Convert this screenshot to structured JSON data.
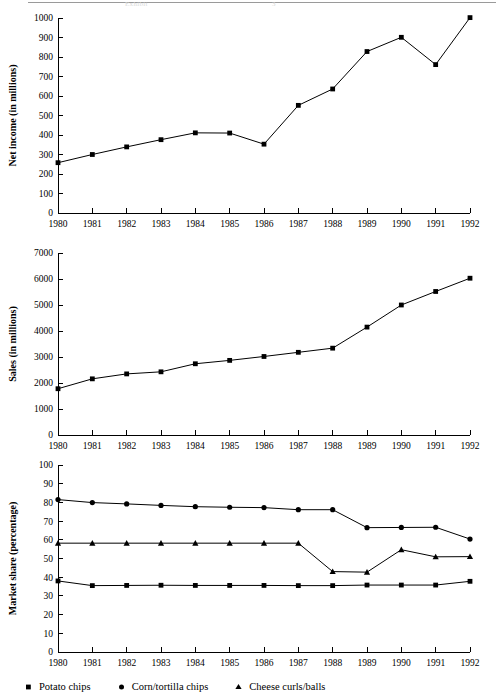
{
  "page": {
    "top_rule_visible": true,
    "ghost_text_left": "Exhibit",
    "ghost_text_right": "3"
  },
  "colors": {
    "ink": "#000000",
    "rule": "#9a9a9a",
    "ghost": "#d9d9d9",
    "background": "#ffffff"
  },
  "legend": {
    "items": [
      {
        "label": "Potato chips",
        "marker": "square",
        "marker_icon": "square-marker-icon"
      },
      {
        "label": "Corn/tortilla chips",
        "marker": "circle",
        "marker_icon": "circle-marker-icon"
      },
      {
        "label": "Cheese curls/balls",
        "marker": "triangle",
        "marker_icon": "triangle-marker-icon"
      }
    ]
  },
  "chart_data": [
    {
      "id": "net-income",
      "type": "line",
      "title": "",
      "xlabel": "",
      "ylabel": "Net income (in millions)",
      "categories": [
        "1980",
        "1981",
        "1982",
        "1983",
        "1984",
        "1985",
        "1986",
        "1987",
        "1988",
        "1989",
        "1990",
        "1991",
        "1992"
      ],
      "x": [
        1980,
        1981,
        1982,
        1983,
        1984,
        1985,
        1986,
        1987,
        1988,
        1989,
        1990,
        1991,
        1992
      ],
      "values": [
        258,
        300,
        339,
        376,
        411,
        410,
        353,
        552,
        636,
        828,
        901,
        761,
        1002
      ],
      "ylim": [
        0,
        1000
      ],
      "ytick_step": 100,
      "yticks": [
        "0",
        "100",
        "200",
        "300",
        "400",
        "500",
        "600",
        "700",
        "800",
        "900",
        "1000"
      ],
      "grid": false,
      "marker": "square",
      "legend_position": "none"
    },
    {
      "id": "sales",
      "type": "line",
      "title": "",
      "xlabel": "",
      "ylabel": "Sales (in millions)",
      "categories": [
        "1980",
        "1981",
        "1982",
        "1983",
        "1984",
        "1985",
        "1986",
        "1987",
        "1988",
        "1989",
        "1990",
        "1991",
        "1992"
      ],
      "x": [
        1980,
        1981,
        1982,
        1983,
        1984,
        1985,
        1986,
        1987,
        1988,
        1989,
        1990,
        1991,
        1992
      ],
      "values": [
        1780,
        2160,
        2350,
        2430,
        2740,
        2870,
        3020,
        3180,
        3340,
        4150,
        5000,
        5520,
        6030
      ],
      "ylim": [
        0,
        7000
      ],
      "ytick_step": 1000,
      "yticks": [
        "0",
        "1000",
        "2000",
        "3000",
        "4000",
        "5000",
        "6000",
        "7000"
      ],
      "grid": false,
      "marker": "square",
      "legend_position": "none"
    },
    {
      "id": "market-share",
      "type": "line",
      "title": "",
      "xlabel": "",
      "ylabel": "Market share (percentage)",
      "categories": [
        "1980",
        "1981",
        "1982",
        "1983",
        "1984",
        "1985",
        "1986",
        "1987",
        "1988",
        "1989",
        "1990",
        "1991",
        "1992"
      ],
      "x": [
        1980,
        1981,
        1982,
        1983,
        1984,
        1985,
        1986,
        1987,
        1988,
        1989,
        1990,
        1991,
        1992
      ],
      "ylim": [
        0,
        100
      ],
      "ytick_step": 10,
      "yticks": [
        "0",
        "10",
        "20",
        "30",
        "40",
        "50",
        "60",
        "70",
        "80",
        "90",
        "100"
      ],
      "grid": false,
      "legend_position": "bottom",
      "series": [
        {
          "name": "Potato chips",
          "marker": "square",
          "values": [
            38.0,
            35.5,
            35.6,
            35.7,
            35.6,
            35.6,
            35.6,
            35.5,
            35.5,
            35.8,
            35.8,
            35.8,
            37.8
          ]
        },
        {
          "name": "Corn/tortilla chips",
          "marker": "circle",
          "values": [
            81.5,
            79.9,
            79.2,
            78.4,
            77.7,
            77.4,
            77.2,
            76.1,
            76.1,
            66.5,
            66.6,
            66.7,
            60.4
          ]
        },
        {
          "name": "Cheese curls/balls",
          "marker": "triangle",
          "values": [
            58.2,
            58.2,
            58.2,
            58.2,
            58.2,
            58.2,
            58.2,
            58.2,
            43.0,
            42.7,
            54.7,
            50.9,
            51.0
          ]
        }
      ]
    }
  ]
}
